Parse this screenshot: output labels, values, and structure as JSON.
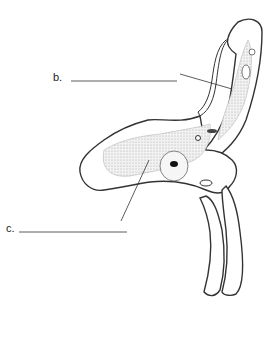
{
  "diagram": {
    "type": "botanical cross-section illustration",
    "labels": [
      {
        "id": "b",
        "text": "b."
      },
      {
        "id": "c",
        "text": "c."
      }
    ],
    "colors": {
      "outline": "#3a3a3a",
      "stipple": "#c8c8c8",
      "background": "#ffffff"
    }
  }
}
